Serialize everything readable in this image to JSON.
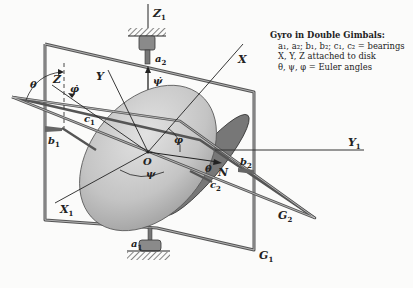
{
  "legend": {
    "title": "Gyro in Double Gimbals:",
    "lines": [
      "a₁, a₂; b₁, b₂; c₁, c₂ = bearings",
      "X, Y, Z attached to disk",
      "θ, ψ, φ  =  Euler angles"
    ]
  },
  "labels": {
    "Z1": "Z",
    "Z1_sub": "1",
    "a2": "a",
    "a2_sub": "2",
    "a1": "a",
    "a1_sub": "1",
    "psi_dot": "ψ̇",
    "X": "X",
    "Y": "Y",
    "Z": "Z",
    "theta_left": "θ",
    "phi_dot": "φ̇",
    "c1": "c",
    "c1_sub": "1",
    "b1": "b",
    "b1_sub": "1",
    "O": "O",
    "phi": "φ",
    "psi": "ψ",
    "theta_dot": "θ̇",
    "N": "N",
    "b2": "b",
    "b2_sub": "2",
    "c2": "c",
    "c2_sub": "2",
    "Y1": "Y",
    "Y1_sub": "1",
    "X1": "X",
    "X1_sub": "1",
    "G1": "G",
    "G1_sub": "1",
    "G2": "G",
    "G2_sub": "2"
  },
  "colors": {
    "ink": "#222222",
    "frame": "#555555",
    "disk_light": "#dcdcdc",
    "disk_dark": "#9a9a9a",
    "background": "#fbfbfa"
  }
}
